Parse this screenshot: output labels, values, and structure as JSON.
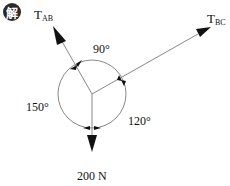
{
  "badge": {
    "text": "解",
    "color": "#2b2b2b"
  },
  "forces": {
    "tab": {
      "main": "T",
      "sub": "AB"
    },
    "tbc": {
      "main": "T",
      "sub": "BC"
    },
    "weight": "200 N"
  },
  "angles": {
    "top": "90°",
    "left": "150°",
    "right": "120°"
  },
  "colors": {
    "line": "#888888",
    "arrow": "#111111",
    "text": "#111111"
  }
}
